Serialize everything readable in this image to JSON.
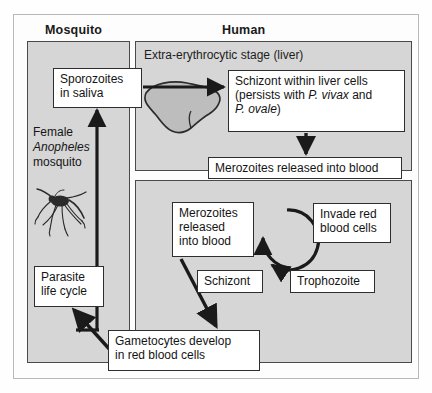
{
  "diagram": {
    "colors": {
      "panel_fill": "#d6d6d6",
      "panel_border": "#4a4a4a",
      "box_fill": "#ffffff",
      "box_border": "#2e2e2e",
      "arrow": "#1a1a1a",
      "liver_fill": "#bdbdbd",
      "page_background": "#fdfdfd"
    },
    "headers": [
      {
        "id": "mosquito",
        "label": "Mosquito"
      },
      {
        "id": "human",
        "label": "Human"
      }
    ],
    "panels": [
      {
        "id": "mosquito",
        "title": ""
      },
      {
        "id": "liver",
        "title": "Extra-erythrocytic stage (liver)"
      },
      {
        "id": "blood",
        "title": ""
      }
    ],
    "mosquito_side": {
      "female_label_line1": "Female",
      "female_label_line2": "Anopheles",
      "female_label_line3": "mosquito",
      "illustration": "mosquito-illustration"
    },
    "boxes": [
      {
        "id": "sporozoites",
        "line1": "Sporozoites",
        "line2": "in saliva"
      },
      {
        "id": "schizont-liver",
        "line1": "Schizont within liver cells",
        "line2": "(persists with ",
        "italic1": "P. vivax",
        "line3": " and",
        "italic2": "P. ovale",
        "line4": ")"
      },
      {
        "id": "merozoites-released",
        "line1": "Merozoites released into blood"
      },
      {
        "id": "merozoites-blood",
        "line1": "Merozoites",
        "line2": "released",
        "line3": "into blood"
      },
      {
        "id": "invade",
        "line1": "Invade red",
        "line2": "blood cells"
      },
      {
        "id": "schizont",
        "line1": "Schizont"
      },
      {
        "id": "trophozoite",
        "line1": "Trophozoite"
      },
      {
        "id": "gametocytes",
        "line1": "Gametocytes develop",
        "line2": "in red blood cells"
      },
      {
        "id": "parasite-cycle",
        "line1": "Parasite",
        "line2": "life cycle"
      }
    ],
    "arrows": [
      {
        "id": "sporozoites-to-schizont",
        "from": "sporozoites",
        "to": "schizont-liver",
        "direction": "right"
      },
      {
        "id": "schizont-to-merozoites",
        "from": "schizont-liver",
        "to": "merozoites-released",
        "direction": "down"
      },
      {
        "id": "merozoites-to-gametocytes",
        "from": "merozoites-blood",
        "to": "gametocytes",
        "direction": "down-left"
      },
      {
        "id": "gametocytes-to-parasite",
        "from": "gametocytes",
        "to": "parasite-cycle",
        "direction": "up-left"
      },
      {
        "id": "parasite-to-sporozoites",
        "from": "parasite-cycle",
        "to": "sporozoites",
        "direction": "up"
      },
      {
        "id": "erythrocytic-cycle",
        "from": "schizont",
        "to": "invade",
        "direction": "circular-clockwise"
      }
    ]
  }
}
